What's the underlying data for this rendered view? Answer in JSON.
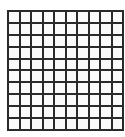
{
  "grid": {
    "rows": 10,
    "columns": 10,
    "line_color": "#2a2a2a",
    "cell_color": "#fafafa"
  }
}
